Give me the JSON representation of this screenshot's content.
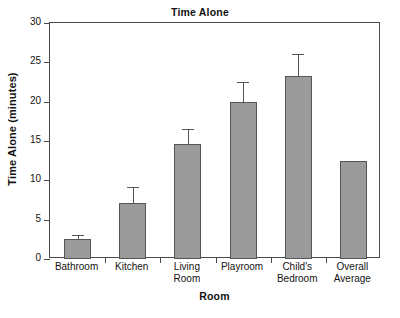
{
  "chart_data": {
    "type": "bar",
    "title": "Time Alone",
    "xlabel": "Room",
    "ylabel": "Time Alone (minutes)",
    "categories": [
      "Bathroom",
      "Kitchen",
      "Living Room",
      "Playroom",
      "Child's Bedroom",
      "Overall Average"
    ],
    "values": [
      2.5,
      7.1,
      14.6,
      19.9,
      23.3,
      12.4
    ],
    "errors": [
      0.6,
      2.1,
      1.9,
      2.6,
      2.7,
      null
    ],
    "ylim": [
      0,
      30
    ],
    "yticks": [
      0,
      5,
      10,
      15,
      20,
      25,
      30
    ],
    "ytick_labels": [
      "0",
      "5",
      "10",
      "15",
      "20",
      "25",
      "30"
    ],
    "grid": false,
    "legend": null,
    "bar_color": "#9b9b9b",
    "bar_edge_color": "#555555",
    "axis_color": "#4a4a4a",
    "background": "#ffffff"
  },
  "category_lines": [
    [
      "Bathroom"
    ],
    [
      "Kitchen"
    ],
    [
      "Living",
      "Room"
    ],
    [
      "Playroom"
    ],
    [
      "Child's",
      "Bedroom"
    ],
    [
      "Overall",
      "Average"
    ]
  ]
}
